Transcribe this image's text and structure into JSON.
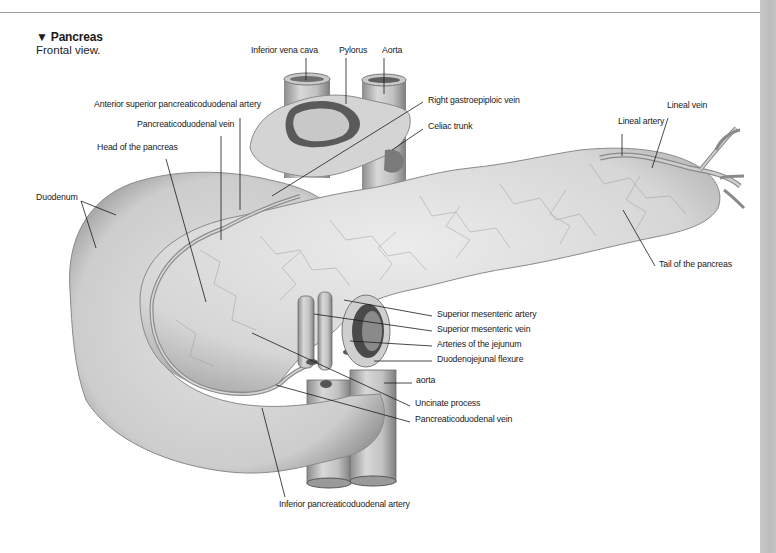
{
  "figure": {
    "title_marker": "▼",
    "title": "Pancreas",
    "subtitle": "Frontal view."
  },
  "colors": {
    "rule": "#9a9a9a",
    "side_strip": "#c4c4c4",
    "tissue_light": "#e4e4e4",
    "tissue_mid": "#cfcfcf",
    "tissue_dark": "#8a8a8a",
    "vessel": "#b8b8b8",
    "leader_line": "#1a1a1a"
  },
  "labels": [
    {
      "id": "inferior-vena-cava",
      "text": "Inferior vena cava",
      "x": 251,
      "y": 50
    },
    {
      "id": "pylorus",
      "text": "Pylorus",
      "x": 339,
      "y": 50
    },
    {
      "id": "aorta-top",
      "text": "Aorta",
      "x": 382,
      "y": 50
    },
    {
      "id": "anterior-superior-pancreaticoduodenal-artery",
      "text": "Anterior superior pancreaticoduodenal artery",
      "x": 94,
      "y": 104
    },
    {
      "id": "right-gastroepiploic-vein",
      "text": "Right gastroepiploic vein",
      "x": 428,
      "y": 100
    },
    {
      "id": "pancreaticoduodenal-vein-top",
      "text": "Pancreaticoduodenal vein",
      "x": 137,
      "y": 124
    },
    {
      "id": "celiac-trunk",
      "text": "Celiac trunk",
      "x": 428,
      "y": 126
    },
    {
      "id": "lineal-vein",
      "text": "Lineal vein",
      "x": 667,
      "y": 105
    },
    {
      "id": "lineal-artery",
      "text": "Lineal artery",
      "x": 618,
      "y": 121
    },
    {
      "id": "head-of-the-pancreas",
      "text": "Head of the pancreas",
      "x": 97,
      "y": 147
    },
    {
      "id": "duodenum",
      "text": "Duodenum",
      "x": 36,
      "y": 197
    },
    {
      "id": "tail-of-the-pancreas",
      "text": "Tail of the pancreas",
      "x": 659,
      "y": 264
    },
    {
      "id": "superior-mesenteric-artery",
      "text": "Superior mesenteric artery",
      "x": 437,
      "y": 314
    },
    {
      "id": "superior-mesenteric-vein",
      "text": "Superior mesenteric vein",
      "x": 437,
      "y": 329
    },
    {
      "id": "arteries-of-the-jejunum",
      "text": "Arteries of the jejunum",
      "x": 437,
      "y": 344
    },
    {
      "id": "duodenojejunal-flexure",
      "text": "Duodenojejunal flexure",
      "x": 437,
      "y": 359
    },
    {
      "id": "aorta-bottom",
      "text": "aorta",
      "x": 416,
      "y": 380
    },
    {
      "id": "uncinate-process",
      "text": "Uncinate process",
      "x": 415,
      "y": 403
    },
    {
      "id": "pancreaticoduodenal-vein-bottom",
      "text": "Pancreaticoduodenal vein",
      "x": 415,
      "y": 419
    },
    {
      "id": "inferior-pancreaticoduodenal-artery",
      "text": "Inferior pancreaticoduodenal artery",
      "x": 279,
      "y": 504
    }
  ],
  "leader_lines": [
    {
      "for": "inferior-vena-cava",
      "x1": 306,
      "y1": 58,
      "x2": 306,
      "y2": 80
    },
    {
      "for": "pylorus",
      "x1": 346,
      "y1": 58,
      "x2": 346,
      "y2": 104
    },
    {
      "for": "aorta-top",
      "x1": 384,
      "y1": 58,
      "x2": 384,
      "y2": 94
    },
    {
      "for": "anterior-superior-pancreaticoduodenal-artery",
      "x1": 240,
      "y1": 118,
      "x2": 240,
      "y2": 210
    },
    {
      "for": "right-gastroepiploic-vein",
      "x1": 423,
      "y1": 102,
      "x2": 272,
      "y2": 196
    },
    {
      "for": "pancreaticoduodenal-vein-top",
      "x1": 221,
      "y1": 136,
      "x2": 221,
      "y2": 240
    },
    {
      "for": "celiac-trunk",
      "x1": 423,
      "y1": 129,
      "x2": 392,
      "y2": 150
    },
    {
      "for": "lineal-vein",
      "x1": 668,
      "y1": 118,
      "x2": 652,
      "y2": 168
    },
    {
      "for": "lineal-artery",
      "x1": 622,
      "y1": 134,
      "x2": 622,
      "y2": 156
    },
    {
      "for": "head-of-the-pancreas",
      "x1": 166,
      "y1": 159,
      "x2": 206,
      "y2": 302
    },
    {
      "for": "duodenum",
      "x1": 81,
      "y1": 201,
      "x2": 116,
      "y2": 215
    },
    {
      "for": "duodenum",
      "x1": 81,
      "y1": 201,
      "x2": 96,
      "y2": 248
    },
    {
      "for": "tail-of-the-pancreas",
      "x1": 655,
      "y1": 266,
      "x2": 623,
      "y2": 210
    },
    {
      "for": "superior-mesenteric-artery",
      "x1": 432,
      "y1": 316,
      "x2": 344,
      "y2": 300
    },
    {
      "for": "superior-mesenteric-vein",
      "x1": 432,
      "y1": 331,
      "x2": 314,
      "y2": 314
    },
    {
      "for": "arteries-of-the-jejunum",
      "x1": 432,
      "y1": 346,
      "x2": 350,
      "y2": 341
    },
    {
      "for": "duodenojejunal-flexure",
      "x1": 432,
      "y1": 361,
      "x2": 374,
      "y2": 361
    },
    {
      "for": "aorta-bottom",
      "x1": 412,
      "y1": 383,
      "x2": 384,
      "y2": 383
    },
    {
      "for": "uncinate-process",
      "x1": 410,
      "y1": 406,
      "x2": 252,
      "y2": 333
    },
    {
      "for": "pancreaticoduodenal-vein-bottom",
      "x1": 410,
      "y1": 422,
      "x2": 276,
      "y2": 385
    },
    {
      "for": "inferior-pancreaticoduodenal-artery",
      "x1": 285,
      "y1": 497,
      "x2": 262,
      "y2": 408
    }
  ]
}
